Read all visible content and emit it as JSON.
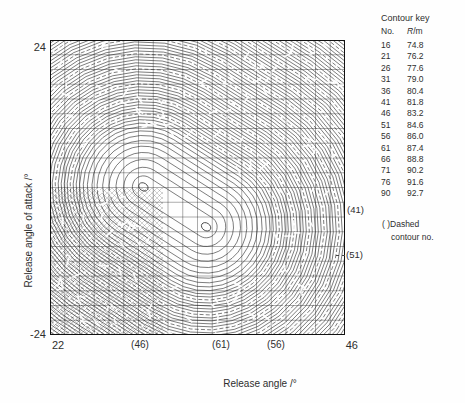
{
  "y_axis": {
    "title": "Release angle of attack /°",
    "top_label": "24",
    "bottom_label": "-24"
  },
  "x_axis": {
    "title": "Release angle /°",
    "left_label": "22",
    "right_label": "46",
    "dashed_labels": [
      {
        "text": "(46)"
      },
      {
        "text": "(61)"
      },
      {
        "text": "(56)"
      }
    ]
  },
  "right_annotations": [
    {
      "text": "(41)"
    },
    {
      "text": "(51)"
    }
  ],
  "contour_key": {
    "title": "Contour key",
    "col_no": "No.",
    "col_r_symbol": "R",
    "col_r_unit": "/m",
    "rows": [
      [
        "16",
        "74.8"
      ],
      [
        "21",
        "76.2"
      ],
      [
        "26",
        "77.6"
      ],
      [
        "31",
        "79.0"
      ],
      [
        "36",
        "80.4"
      ],
      [
        "41",
        "81.8"
      ],
      [
        "46",
        "83.2"
      ],
      [
        "51",
        "84.6"
      ],
      [
        "56",
        "86.0"
      ],
      [
        "61",
        "87.4"
      ],
      [
        "66",
        "88.8"
      ],
      [
        "71",
        "90.2"
      ],
      [
        "76",
        "91.6"
      ],
      [
        "90",
        "92.7"
      ]
    ]
  },
  "note": {
    "line1": "( )Dashed",
    "line2": "contour no."
  },
  "chart_data": {
    "type": "contour",
    "title": "",
    "xlabel": "Release angle /°",
    "ylabel": "Release angle of attack /°",
    "xlim": [
      22,
      46
    ],
    "ylim": [
      -24,
      24
    ],
    "grid": true,
    "value_label": "R/m",
    "levels": {
      "numbers": [
        16,
        21,
        26,
        31,
        36,
        41,
        46,
        51,
        56,
        61,
        66,
        71,
        76,
        90
      ],
      "values_m": [
        74.8,
        76.2,
        77.6,
        79.0,
        80.4,
        81.8,
        83.2,
        84.6,
        86.0,
        87.4,
        88.8,
        90.2,
        91.6,
        92.7
      ]
    },
    "peak": {
      "value_m": 92.7,
      "centers_deg": [
        [
          29.6,
          0.1
        ],
        [
          34.7,
          -6.4
        ]
      ]
    },
    "dashed_contour_annotations": {
      "bottom_axis": [
        {
          "level": 46,
          "release_angle_deg": 29.3
        },
        {
          "level": 61,
          "release_angle_deg": 35.9
        },
        {
          "level": 56,
          "release_angle_deg": 40.4
        }
      ],
      "right_axis": [
        {
          "level": 41,
          "attack_angle_deg": -3.6
        },
        {
          "level": 51,
          "attack_angle_deg": -11.0
        }
      ]
    },
    "line_color": "#1c1c1c"
  }
}
